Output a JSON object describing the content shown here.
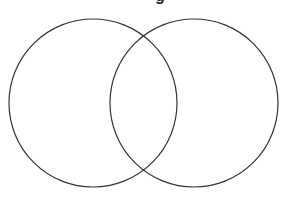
{
  "diagram": {
    "type": "venn",
    "title_fragment": "g",
    "stroke_color": "#333333",
    "background": "#ffffff",
    "sets": [
      {
        "name": "left-set",
        "cx": 93,
        "cy": 103,
        "r": 84,
        "label": ""
      },
      {
        "name": "right-set",
        "cx": 194,
        "cy": 103,
        "r": 84,
        "label": ""
      }
    ]
  }
}
